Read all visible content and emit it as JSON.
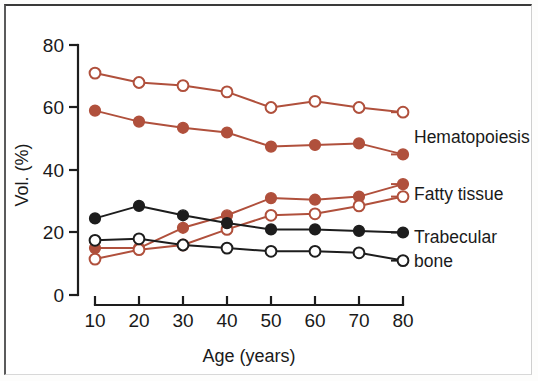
{
  "chart_data": {
    "type": "line",
    "title": "",
    "xlabel": "Age (years)",
    "ylabel": "Vol. (%)",
    "x": [
      10,
      20,
      30,
      40,
      50,
      60,
      70,
      80
    ],
    "xtick_labels": [
      "10",
      "20",
      "30",
      "40",
      "50",
      "60",
      "70",
      "80"
    ],
    "ytick_labels": [
      "0",
      "20",
      "40",
      "60",
      "80"
    ],
    "yticks": [
      0,
      20,
      40,
      60,
      80
    ],
    "xlim": [
      5,
      85
    ],
    "ylim": [
      0,
      80
    ],
    "grid": false,
    "legend_position": "right-inline-labels",
    "colors": {
      "red": "#b0503c",
      "black": "#1d1d1d",
      "open_fill": "#ffffff",
      "background": "#ffffff"
    },
    "series": [
      {
        "name": "Hematopoiesis open",
        "group": "Hematopoiesis",
        "marker": "open-circle",
        "color": "#b0503c",
        "values": [
          71,
          68,
          67,
          65,
          60,
          62,
          60,
          58.5
        ]
      },
      {
        "name": "Hematopoiesis filled",
        "group": "Hematopoiesis",
        "marker": "filled-circle",
        "color": "#b0503c",
        "values": [
          59,
          55.5,
          53.5,
          52,
          47.5,
          48,
          48.5,
          45
        ]
      },
      {
        "name": "Fatty tissue filled",
        "group": "Fatty tissue",
        "marker": "filled-circle",
        "color": "#b0503c",
        "values": [
          15,
          15,
          21.5,
          25.5,
          31,
          30.5,
          31.5,
          35.5
        ]
      },
      {
        "name": "Fatty tissue open",
        "group": "Fatty tissue",
        "marker": "open-circle",
        "color": "#b0503c",
        "values": [
          11.5,
          14.5,
          16,
          21,
          25.5,
          26,
          28.5,
          31.5
        ]
      },
      {
        "name": "Trabecular bone filled",
        "group": "Trabecular bone",
        "marker": "filled-circle",
        "color": "#1d1d1d",
        "values": [
          24.5,
          28.5,
          25.5,
          23,
          21,
          21,
          20.5,
          20
        ]
      },
      {
        "name": "Trabecular bone open",
        "group": "Trabecular bone",
        "marker": "open-circle",
        "color": "#1d1d1d",
        "values": [
          17.5,
          18,
          16,
          15,
          14,
          14,
          13.5,
          11
        ]
      }
    ],
    "annotations": [
      {
        "text": "Hematopoiesis",
        "x": 80,
        "y": 51
      },
      {
        "text": "Fatty tissue",
        "x": 80,
        "y": 33
      },
      {
        "text": "Trabecular",
        "x": 80,
        "y": 20
      },
      {
        "text": "bone",
        "x": 80,
        "y": 13
      }
    ]
  },
  "labels": {
    "y_axis_title": "Vol. (%)",
    "x_axis_title": "Age (years)",
    "hematopoiesis": "Hematopoiesis",
    "fatty_tissue": "Fatty tissue",
    "trabecular": "Trabecular",
    "bone": "bone",
    "y0": "0",
    "y20": "20",
    "y40": "40",
    "y60": "60",
    "y80": "80",
    "x10": "10",
    "x20": "20",
    "x30": "30",
    "x40": "40",
    "x50": "50",
    "x60": "60",
    "x70": "70",
    "x80": "80"
  }
}
